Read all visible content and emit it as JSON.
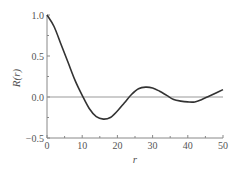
{
  "chart_data": {
    "type": "line",
    "title": "",
    "xlabel": "r",
    "ylabel": "R(r)",
    "xlim": [
      0,
      50
    ],
    "ylim": [
      -0.5,
      1.0
    ],
    "xticks": [
      "0",
      "10",
      "20",
      "30",
      "40",
      "50"
    ],
    "yticks": [
      "−0.5",
      "0.0",
      "0.5",
      "1.0"
    ],
    "grid": false,
    "reference_line": 0.0,
    "series": [
      {
        "name": "R(r)",
        "x": [
          0,
          2,
          4,
          6,
          8,
          10,
          12,
          14,
          16,
          18,
          20,
          22,
          24,
          26,
          28,
          30,
          32,
          34,
          36,
          38,
          40,
          42,
          44,
          46,
          48,
          50
        ],
        "values": [
          1.0,
          0.86,
          0.64,
          0.42,
          0.2,
          0.02,
          -0.14,
          -0.24,
          -0.27,
          -0.25,
          -0.17,
          -0.07,
          0.03,
          0.1,
          0.12,
          0.11,
          0.07,
          0.02,
          -0.03,
          -0.05,
          -0.06,
          -0.06,
          -0.03,
          0.01,
          0.05,
          0.09
        ]
      }
    ]
  }
}
